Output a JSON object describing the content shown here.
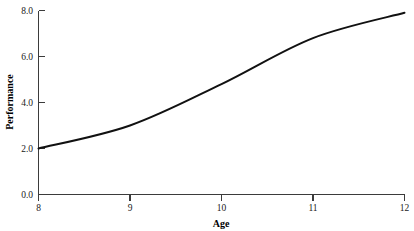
{
  "chart_data": {
    "type": "line",
    "title": "",
    "subtitle": "",
    "xlabel": "Age",
    "ylabel": "Performance",
    "x": [
      8,
      9,
      10,
      11,
      12
    ],
    "categories": [
      "8",
      "9",
      "10",
      "11",
      "12"
    ],
    "values": [
      2.0,
      3.0,
      4.8,
      6.8,
      7.9
    ],
    "series": [
      {
        "name": "Performance",
        "values": [
          2.0,
          3.0,
          4.8,
          6.8,
          7.9
        ],
        "color": "#111111"
      }
    ],
    "xlim": [
      8,
      12
    ],
    "ylim": [
      0.0,
      8.0
    ],
    "xticks": [
      8,
      9,
      10,
      11,
      12
    ],
    "xtick_labels": [
      "8",
      "9",
      "10",
      "11",
      "12"
    ],
    "yticks": [
      0.0,
      2.0,
      4.0,
      6.0,
      8.0
    ],
    "ytick_labels": [
      "0.0",
      "2.0",
      "4.0",
      "6.0",
      "8.0"
    ],
    "grid": false,
    "legend": "none",
    "line_color": "#111111",
    "line_width": 2,
    "axis_color": "#3b3b3b",
    "background_color": "#ffffff",
    "annotations": []
  },
  "axes": {
    "y_title": "Performance",
    "x_title": "Age"
  },
  "ytick_labels": {
    "t0": "8.0",
    "t1": "6.0",
    "t2": "4.0",
    "t3": "2.0",
    "t4": "0.0"
  },
  "xtick_labels": {
    "t0": "8",
    "t1": "9",
    "t2": "10",
    "t3": "11",
    "t4": "12"
  }
}
